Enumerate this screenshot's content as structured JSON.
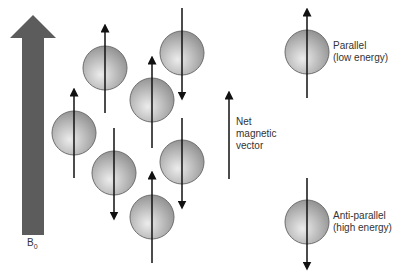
{
  "field": {
    "label_main": "B",
    "label_sub": "0",
    "color": "#5a5a5a"
  },
  "net_vector": {
    "line1": "Net",
    "line2": "magnetic",
    "line3": "vector"
  },
  "legend": {
    "parallel": {
      "line1": "Parallel",
      "line2": "(low energy)"
    },
    "antiparallel": {
      "line1": "Anti-parallel",
      "line2": "(high energy)"
    }
  },
  "spins": [
    {
      "cx": 74,
      "cy": 133,
      "dir": "up"
    },
    {
      "cx": 105,
      "cy": 68,
      "dir": "up"
    },
    {
      "cx": 114,
      "cy": 173,
      "dir": "down"
    },
    {
      "cx": 152,
      "cy": 100,
      "dir": "up"
    },
    {
      "cx": 182,
      "cy": 53,
      "dir": "down"
    },
    {
      "cx": 182,
      "cy": 162,
      "dir": "down"
    },
    {
      "cx": 152,
      "cy": 217,
      "dir": "up"
    }
  ],
  "colors": {
    "sphere_light": "#e6e6e6",
    "sphere_dark": "#9a9a9a",
    "sphere_stroke": "#6e6e6e",
    "arrow": "#111111"
  }
}
